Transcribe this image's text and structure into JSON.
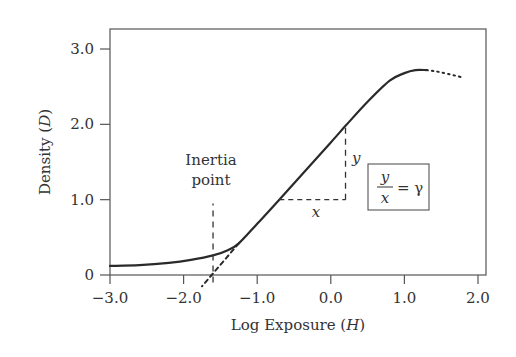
{
  "chart_data": {
    "type": "line",
    "title": "",
    "xlabel": "Log Exposure (H)",
    "xlabel_parts": {
      "text": "Log Exposure (",
      "var": "H",
      "close": ")"
    },
    "ylabel": "Density (D)",
    "ylabel_parts": {
      "text": "Density (",
      "var": "D",
      "close": ")"
    },
    "xlim": [
      -3.0,
      2.1
    ],
    "ylim": [
      0,
      3.25
    ],
    "x_ticks": [
      -3.0,
      -2.0,
      -1.0,
      0.0,
      1.0,
      2.0
    ],
    "x_tick_labels": [
      "−3.0",
      "−2.0",
      "−1.0",
      "0.0",
      "1.0",
      "2.0"
    ],
    "y_ticks": [
      0,
      1.0,
      2.0,
      3.0
    ],
    "y_tick_labels": [
      "0",
      "1.0",
      "2.0",
      "3.0"
    ],
    "grid": false,
    "legend": "none",
    "series": [
      {
        "name": "Characteristic curve",
        "style": "solid",
        "points": [
          [
            -3.0,
            0.12
          ],
          [
            -2.6,
            0.13
          ],
          [
            -2.2,
            0.16
          ],
          [
            -1.9,
            0.2
          ],
          [
            -1.6,
            0.26
          ],
          [
            -1.4,
            0.33
          ],
          [
            -1.25,
            0.42
          ],
          [
            -1.0,
            0.68
          ],
          [
            -0.7,
            1.0
          ],
          [
            0.0,
            1.76
          ],
          [
            0.2,
            1.98
          ],
          [
            0.5,
            2.3
          ],
          [
            0.8,
            2.58
          ],
          [
            1.0,
            2.68
          ],
          [
            1.15,
            2.72
          ],
          [
            1.3,
            2.72
          ]
        ]
      },
      {
        "name": "Shoulder (extrapolated)",
        "style": "dotted",
        "points": [
          [
            1.3,
            2.72
          ],
          [
            1.5,
            2.69
          ],
          [
            1.8,
            2.62
          ]
        ]
      },
      {
        "name": "Straight-line extrapolation to inertia point",
        "style": "dashed",
        "points": [
          [
            -1.25,
            0.42
          ],
          [
            -1.75,
            -0.15
          ]
        ]
      }
    ],
    "annotations": [
      {
        "type": "vline",
        "x": -1.6,
        "y_range": [
          -0.1,
          0.95
        ],
        "style": "dashed",
        "label": "Inertia point"
      },
      {
        "type": "hline",
        "y": 1.0,
        "x_range": [
          -0.7,
          0.2
        ],
        "style": "dashed",
        "label": "x"
      },
      {
        "type": "vline",
        "x": 0.2,
        "y_range": [
          1.0,
          1.98
        ],
        "style": "dashed",
        "label": "y"
      },
      {
        "type": "box",
        "text": "y/x = γ"
      }
    ]
  },
  "labels": {
    "inertia_line1": "Inertia",
    "inertia_line2": "point",
    "delta_x": "x",
    "delta_y": "y",
    "formula_num": "y",
    "formula_den": "x",
    "formula_eq": "= γ"
  }
}
